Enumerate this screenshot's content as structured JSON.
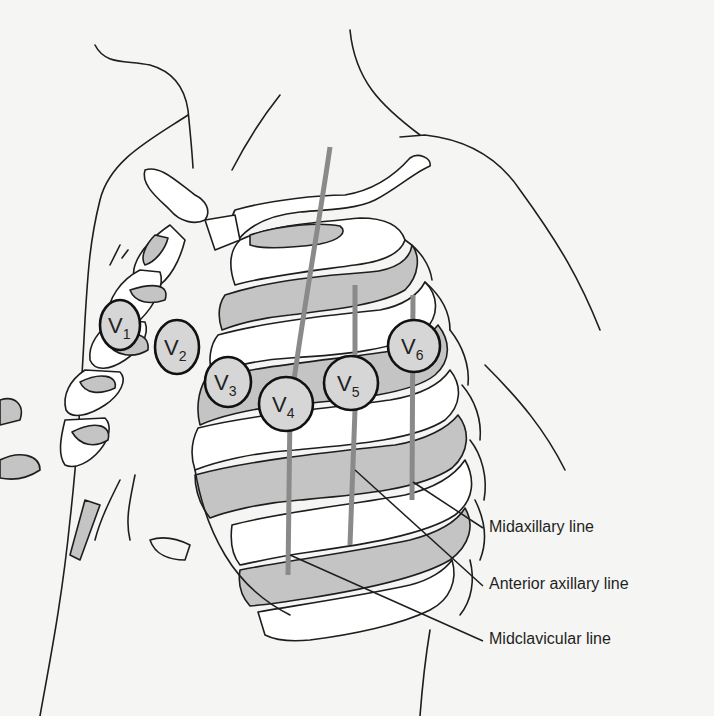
{
  "figure": {
    "electrodes": [
      {
        "id": "V1",
        "letter": "V",
        "sub": "1"
      },
      {
        "id": "V2",
        "letter": "V",
        "sub": "2"
      },
      {
        "id": "V3",
        "letter": "V",
        "sub": "3"
      },
      {
        "id": "V4",
        "letter": "V",
        "sub": "4"
      },
      {
        "id": "V5",
        "letter": "V",
        "sub": "5"
      },
      {
        "id": "V6",
        "letter": "V",
        "sub": "6"
      }
    ],
    "reference_lines": [
      {
        "label": "Midaxillary line"
      },
      {
        "label": "Anterior axillary line"
      },
      {
        "label": "Midclavicular line"
      }
    ],
    "colors": {
      "background": "#f5f5f3",
      "outline": "#1e1e1e",
      "rib_shading": "#c4c4c4",
      "electrode_fill": "#d6d6d6",
      "reference_line": "#8a8a8a"
    }
  }
}
